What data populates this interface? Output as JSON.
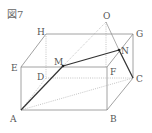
{
  "figure": {
    "title": "図7",
    "type": "rectangular prism with pyramid apex",
    "points": {
      "A": {
        "label": "A",
        "x": 21,
        "y": 110
      },
      "B": {
        "label": "B",
        "x": 107,
        "y": 110
      },
      "C": {
        "label": "C",
        "x": 133,
        "y": 78
      },
      "D": {
        "label": "D",
        "x": 46,
        "y": 78
      },
      "E": {
        "label": "E",
        "x": 21,
        "y": 67
      },
      "F": {
        "label": "F",
        "x": 107,
        "y": 67
      },
      "G": {
        "label": "G",
        "x": 133,
        "y": 34
      },
      "H": {
        "label": "H",
        "x": 46,
        "y": 34
      },
      "O": {
        "label": "O",
        "x": 106,
        "y": 22
      },
      "M": {
        "label": "M",
        "x": 63,
        "y": 66
      },
      "N": {
        "label": "N",
        "x": 119,
        "y": 50
      }
    },
    "solid_edges": [
      "A-B",
      "B-C",
      "C-G",
      "G-H",
      "H-E",
      "E-A",
      "E-F",
      "F-B",
      "F-G"
    ],
    "hidden_edges": [
      "A-D",
      "D-C",
      "D-H"
    ],
    "bold_segments": [
      "A-M",
      "M-N",
      "N-C"
    ],
    "construction_lines": [
      "O-M",
      "O-F",
      "O-N",
      "A-C",
      "D-C"
    ],
    "colors": {
      "line": "#8a8a8a",
      "bold": "#333333",
      "label": "#555555",
      "dotted": "#aaaaaa"
    }
  }
}
